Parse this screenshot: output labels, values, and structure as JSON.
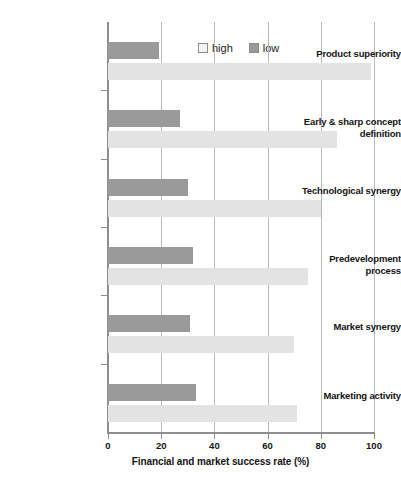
{
  "chart_data": {
    "type": "bar",
    "orientation": "horizontal",
    "title": "",
    "xlabel": "Financial and market success rate (%)",
    "ylabel": "",
    "xlim": [
      0,
      100
    ],
    "xticks": [
      0,
      20,
      40,
      60,
      80,
      100
    ],
    "grid": "vertical",
    "legend_position": "top-center",
    "categories": [
      "Product superiority",
      "Early & sharp concept definition",
      "Technological synergy",
      "Predevelopment process",
      "Market synergy",
      "Marketing activity"
    ],
    "series": [
      {
        "name": "high",
        "color": "#e3e3e3",
        "values": [
          99,
          86,
          80,
          75,
          70,
          71
        ]
      },
      {
        "name": "low",
        "color": "#9a9a9a",
        "values": [
          19,
          27,
          30,
          32,
          31,
          33
        ]
      }
    ]
  },
  "legend": {
    "items": [
      {
        "label": "high",
        "swatch": "legend-swatch-high"
      },
      {
        "label": "low",
        "swatch": "legend-swatch-low"
      }
    ]
  },
  "axis": {
    "x_title": "Financial and market success rate (%)",
    "tick_labels": [
      "0",
      "20",
      "40",
      "60",
      "80",
      "100"
    ]
  },
  "colors": {
    "high_bar": "#e3e3e3",
    "low_bar": "#9a9a9a",
    "axis": "#8e8e8e",
    "gridline": "#b9b9b9",
    "text": "#141414",
    "background": "#ffffff"
  }
}
